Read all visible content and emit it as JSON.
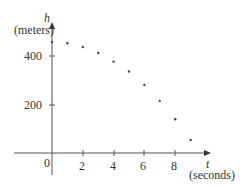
{
  "chart_data": {
    "type": "scatter",
    "title": "",
    "xlabel": "t",
    "xlabel_units": "(seconds)",
    "ylabel": "h",
    "ylabel_units": "(meters)",
    "x_ticks": [
      0,
      2,
      4,
      6,
      8
    ],
    "y_ticks": [
      200,
      400
    ],
    "xlim": [
      -1.3,
      10
    ],
    "ylim": [
      -60,
      510
    ],
    "grid": false,
    "legend": null,
    "points": [
      {
        "x": 0,
        "y": 455
      },
      {
        "x": 1,
        "y": 450
      },
      {
        "x": 2,
        "y": 435
      },
      {
        "x": 3,
        "y": 410
      },
      {
        "x": 4,
        "y": 375
      },
      {
        "x": 5,
        "y": 335
      },
      {
        "x": 6,
        "y": 280
      },
      {
        "x": 7,
        "y": 215
      },
      {
        "x": 8,
        "y": 140
      },
      {
        "x": 9,
        "y": 55
      }
    ]
  },
  "labels": {
    "origin": "0",
    "x_ticks": [
      "2",
      "4",
      "6",
      "8"
    ],
    "y_ticks": [
      "200",
      "400"
    ],
    "x_var": "t",
    "x_units": "(seconds)",
    "y_var": "h",
    "y_units": "(meters)"
  }
}
